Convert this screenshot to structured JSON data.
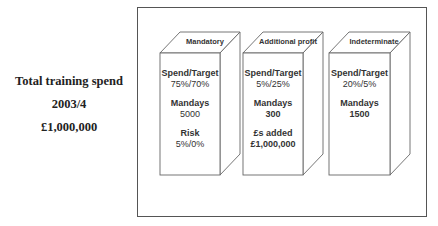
{
  "summary": {
    "title": "Total training spend",
    "year": "2003/4",
    "amount": "£1,000,000"
  },
  "boxes": [
    {
      "title": "Mandatory",
      "items": [
        {
          "label": "Spend/Target",
          "value": "75%/70%"
        },
        {
          "label": "Mandays",
          "value": "5000"
        },
        {
          "label": "Risk",
          "value": "5%/0%"
        }
      ]
    },
    {
      "title": "Additional profit",
      "items": [
        {
          "label": "Spend/Target",
          "value": "5%/25%"
        },
        {
          "label": "Mandays",
          "value": "300"
        },
        {
          "label": "£s added",
          "value": "£1,000,000"
        }
      ]
    },
    {
      "title": "Indeterminate",
      "items": [
        {
          "label": "Spend/Target",
          "value": "20%/5%"
        },
        {
          "label": "Mandays",
          "value": "1500"
        }
      ]
    }
  ],
  "colors": {
    "line": "#555555",
    "text": "#333333",
    "background": "#ffffff"
  }
}
